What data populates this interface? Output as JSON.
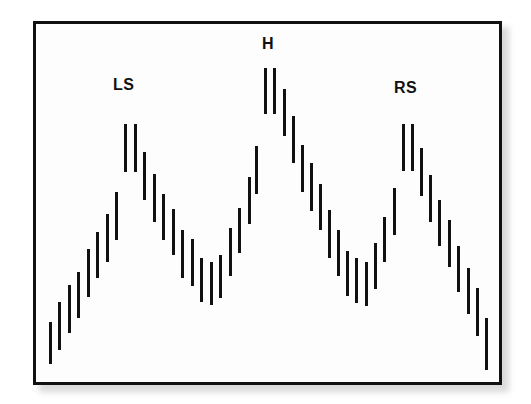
{
  "figure": {
    "background_color": "#ffffff",
    "width": 531,
    "height": 404
  },
  "frame": {
    "border_color": "#111111",
    "border_width_px": 3,
    "fill_color": "#fdfdfd",
    "shadow_color": "#b9b9b9"
  },
  "chart_data": {
    "type": "bar",
    "subtype": "price-range-bars",
    "title": "",
    "subtitle": "",
    "xlabel": "",
    "ylabel": "",
    "grid": false,
    "legend": null,
    "bar_color": "#111111",
    "bar_width_px": 3,
    "xlim": [
      0,
      48
    ],
    "ylim": [
      0,
      100
    ],
    "annotations": [
      {
        "text": "LS",
        "name": "left-shoulder",
        "x_index": 9,
        "y_value": 79
      },
      {
        "text": "H",
        "name": "head",
        "x_index": 24,
        "y_value": 94
      },
      {
        "text": "RS",
        "name": "right-shoulder",
        "x_index": 39,
        "y_value": 79
      }
    ],
    "categories": [
      1,
      2,
      3,
      4,
      5,
      6,
      7,
      8,
      9,
      10,
      11,
      12,
      13,
      14,
      15,
      16,
      17,
      18,
      19,
      20,
      21,
      22,
      23,
      24,
      25,
      26,
      27,
      28,
      29,
      30,
      31,
      32,
      33,
      34,
      35,
      36,
      37,
      38,
      39,
      40,
      41,
      42,
      43,
      44,
      45,
      46,
      47,
      48
    ],
    "series": [
      {
        "name": "low",
        "values": [
          10,
          17,
          22,
          26,
          33,
          39,
          45,
          52,
          59,
          58,
          52,
          47,
          42,
          38,
          33,
          30,
          26,
          24,
          25,
          31,
          37,
          43,
          50,
          57,
          63,
          68,
          63,
          57,
          51,
          45,
          40,
          35,
          30,
          27,
          26,
          29,
          35,
          41,
          47,
          53,
          58,
          52,
          46,
          40,
          33,
          27,
          21,
          12
        ]
      },
      {
        "name": "high",
        "values": [
          22,
          29,
          35,
          40,
          47,
          53,
          59,
          66,
          73,
          72,
          66,
          60,
          54,
          50,
          45,
          42,
          38,
          36,
          38,
          44,
          50,
          57,
          64,
          71,
          78,
          82,
          77,
          71,
          64,
          58,
          53,
          48,
          43,
          39,
          38,
          42,
          48,
          54,
          61,
          68,
          73,
          66,
          60,
          53,
          47,
          41,
          35,
          25
        ]
      }
    ]
  },
  "bars": [
    {
      "x": 49,
      "top": 322,
      "bottom": 364
    },
    {
      "x": 58,
      "top": 302,
      "bottom": 350
    },
    {
      "x": 68,
      "top": 285,
      "bottom": 333
    },
    {
      "x": 77,
      "top": 272,
      "bottom": 318
    },
    {
      "x": 87,
      "top": 249,
      "bottom": 297
    },
    {
      "x": 96,
      "top": 232,
      "bottom": 278
    },
    {
      "x": 106,
      "top": 214,
      "bottom": 262
    },
    {
      "x": 115,
      "top": 192,
      "bottom": 240
    },
    {
      "x": 124,
      "top": 124,
      "bottom": 172
    },
    {
      "x": 134,
      "top": 124,
      "bottom": 172
    },
    {
      "x": 143,
      "top": 152,
      "bottom": 200
    },
    {
      "x": 153,
      "top": 174,
      "bottom": 222
    },
    {
      "x": 162,
      "top": 194,
      "bottom": 240
    },
    {
      "x": 172,
      "top": 209,
      "bottom": 255
    },
    {
      "x": 181,
      "top": 230,
      "bottom": 278
    },
    {
      "x": 191,
      "top": 239,
      "bottom": 286
    },
    {
      "x": 200,
      "top": 258,
      "bottom": 302
    },
    {
      "x": 210,
      "top": 262,
      "bottom": 305
    },
    {
      "x": 219,
      "top": 255,
      "bottom": 298
    },
    {
      "x": 229,
      "top": 228,
      "bottom": 276
    },
    {
      "x": 238,
      "top": 208,
      "bottom": 253
    },
    {
      "x": 248,
      "top": 177,
      "bottom": 224
    },
    {
      "x": 255,
      "top": 146,
      "bottom": 194
    },
    {
      "x": 264,
      "top": 68,
      "bottom": 114
    },
    {
      "x": 273,
      "top": 68,
      "bottom": 114
    },
    {
      "x": 283,
      "top": 89,
      "bottom": 136
    },
    {
      "x": 292,
      "top": 116,
      "bottom": 163
    },
    {
      "x": 301,
      "top": 145,
      "bottom": 192
    },
    {
      "x": 310,
      "top": 163,
      "bottom": 211
    },
    {
      "x": 319,
      "top": 184,
      "bottom": 230
    },
    {
      "x": 328,
      "top": 210,
      "bottom": 258
    },
    {
      "x": 337,
      "top": 230,
      "bottom": 276
    },
    {
      "x": 346,
      "top": 251,
      "bottom": 296
    },
    {
      "x": 355,
      "top": 258,
      "bottom": 303
    },
    {
      "x": 365,
      "top": 262,
      "bottom": 306
    },
    {
      "x": 374,
      "top": 243,
      "bottom": 289
    },
    {
      "x": 383,
      "top": 217,
      "bottom": 262
    },
    {
      "x": 393,
      "top": 188,
      "bottom": 235
    },
    {
      "x": 402,
      "top": 124,
      "bottom": 171
    },
    {
      "x": 411,
      "top": 124,
      "bottom": 171
    },
    {
      "x": 420,
      "top": 148,
      "bottom": 196
    },
    {
      "x": 429,
      "top": 175,
      "bottom": 222
    },
    {
      "x": 438,
      "top": 200,
      "bottom": 246
    },
    {
      "x": 448,
      "top": 220,
      "bottom": 267
    },
    {
      "x": 457,
      "top": 246,
      "bottom": 292
    },
    {
      "x": 467,
      "top": 268,
      "bottom": 314
    },
    {
      "x": 476,
      "top": 288,
      "bottom": 336
    },
    {
      "x": 485,
      "top": 318,
      "bottom": 370
    }
  ],
  "labels": {
    "left_shoulder": {
      "text": "LS",
      "x": 113,
      "y": 77
    },
    "head": {
      "text": "H",
      "x": 262,
      "y": 36
    },
    "right_shoulder": {
      "text": "RS",
      "x": 394,
      "y": 80
    }
  }
}
